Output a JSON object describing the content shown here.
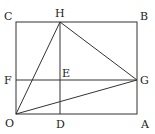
{
  "diagram": {
    "type": "geometry",
    "points": {
      "O": {
        "label": "O",
        "x": 16,
        "y": 114
      },
      "D": {
        "label": "D",
        "x": 60,
        "y": 114
      },
      "A": {
        "label": "A",
        "x": 137,
        "y": 114
      },
      "F": {
        "label": "F",
        "x": 16,
        "y": 80
      },
      "E": {
        "label": "E",
        "x": 60,
        "y": 80
      },
      "G": {
        "label": "G",
        "x": 137,
        "y": 80
      },
      "C": {
        "label": "C",
        "x": 16,
        "y": 22
      },
      "H": {
        "label": "H",
        "x": 60,
        "y": 22
      },
      "B": {
        "label": "B",
        "x": 137,
        "y": 22
      }
    },
    "segments": [
      [
        "O",
        "A"
      ],
      [
        "A",
        "B"
      ],
      [
        "B",
        "C"
      ],
      [
        "C",
        "O"
      ],
      [
        "H",
        "D"
      ],
      [
        "F",
        "G"
      ],
      [
        "O",
        "H"
      ],
      [
        "H",
        "G"
      ],
      [
        "O",
        "G"
      ]
    ],
    "stroke_color": "#333333"
  }
}
